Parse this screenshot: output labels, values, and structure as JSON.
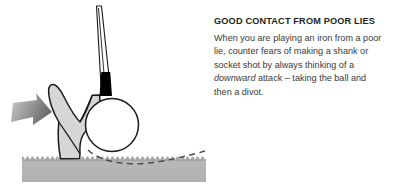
{
  "figure": {
    "caption_heading": "GOOD CONTACT FROM POOR LIES",
    "body_part_1": "When you are playing an iron from a poor lie, counter fears of making a shank or socket shot by always thinking of a ",
    "body_emphasis": "downward",
    "body_part_2": " attack – taking the ball and then a divot.",
    "elements": {
      "club_shaft": "club-shaft",
      "club_ferrule": "club-ferrule",
      "club_head": "iron-club-head",
      "golf_ball": "golf-ball",
      "ground": "turf-ground",
      "divot_path": "dashed-swing-path",
      "force_arrow": "downward-attack-arrow"
    }
  },
  "colors": {
    "ink": "#231f20",
    "body_text": "#3a3a3c",
    "club_fill": "#d6d6d6",
    "club_stroke": "#1a1a1a",
    "ferrule": "#000000",
    "ball_fill": "#ffffff",
    "ground_fill": "#b3b3b3",
    "ground_top": "#9b9b9b",
    "arrow_light": "#c9c9c9",
    "arrow_dark": "#6e6e6e",
    "dash": "#4d4d4d",
    "background": "#ffffff"
  }
}
